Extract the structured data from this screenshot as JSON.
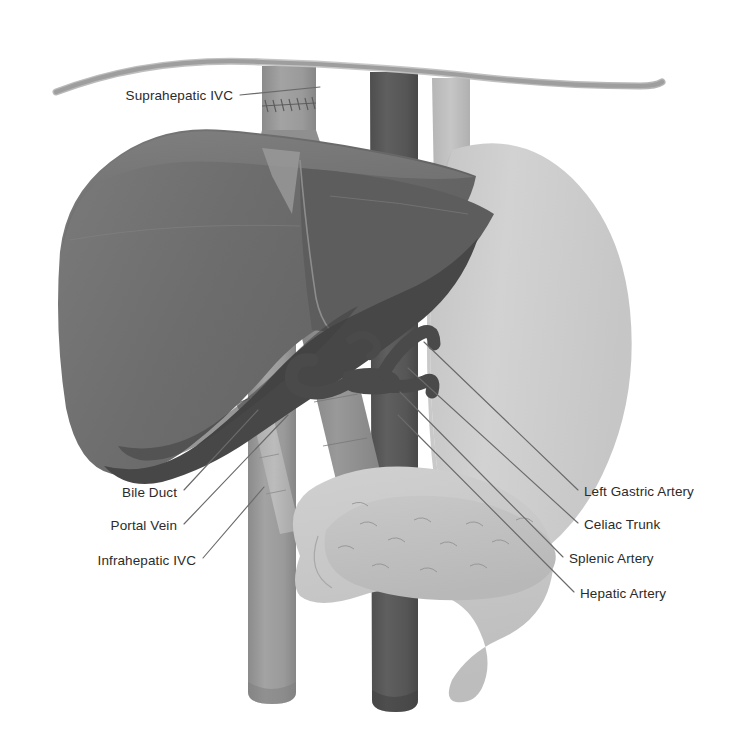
{
  "figure": {
    "background_color": "#ffffff"
  },
  "palette": {
    "liver_main": "#6e6e6e",
    "liver_upper": "#747474",
    "liver_shadow": "#474747",
    "liver_lobe_dark": "#5b5b5b",
    "stomach": "#cfcfcf",
    "duodenum": "#c9c9c9",
    "pancreas": "#c2c2c2",
    "aorta": "#595959",
    "ivc": "#9a9a9a",
    "portal_vein": "#8f8f8f",
    "bile_duct": "#b4b4b4",
    "artery_dark": "#4e4e4e",
    "diaphragm": "#9e9e9e",
    "leader_line": "#6a6a6a",
    "label_text": "#2b2b2b"
  },
  "labels": {
    "suprahepatic_ivc": {
      "text": "Suprahepatic IVC",
      "side": "left",
      "text_x": 233,
      "text_y": 100,
      "leader": "M 240 95 L 320 87"
    },
    "bile_duct": {
      "text": "Bile Duct",
      "side": "left",
      "text_x": 177,
      "text_y": 497,
      "leader": "M 184 490 L 258 410"
    },
    "portal_vein": {
      "text": "Portal Vein",
      "side": "left",
      "text_x": 177,
      "text_y": 530,
      "leader": "M 184 524 L 288 415"
    },
    "infrahepatic_ivc": {
      "text": "Infrahepatic IVC",
      "side": "left",
      "text_x": 196,
      "text_y": 565,
      "leader": "M 203 558 L 264 487"
    },
    "left_gastric_artery": {
      "text": "Left Gastric Artery",
      "side": "right",
      "text_x": 584,
      "text_y": 496,
      "leader": "M 578 490 L 424 342"
    },
    "celiac_trunk": {
      "text": "Celiac Trunk",
      "side": "right",
      "text_x": 584,
      "text_y": 529,
      "leader": "M 578 523 L 408 368"
    },
    "splenic_artery": {
      "text": "Splenic Artery",
      "side": "right",
      "text_x": 569,
      "text_y": 563,
      "leader": "M 563 557 L 400 392"
    },
    "hepatic_artery": {
      "text": "Hepatic Artery",
      "side": "right",
      "text_x": 580,
      "text_y": 598,
      "leader": "M 574 592 L 398 415"
    }
  },
  "structures": {
    "diaphragm": "diaphragm-line",
    "liver": "liver-organ",
    "stomach": "stomach-organ",
    "duodenum": "duodenum-organ",
    "pancreas": "pancreas-organ",
    "aorta": "aorta-vessel",
    "ivc_suprahepatic": "suprahepatic-ivc-vessel",
    "ivc_infrahepatic": "infrahepatic-ivc-vessel",
    "portal_vein": "portal-vein-vessel",
    "bile_duct": "bile-duct-structure",
    "esophagus": "esophagus-structure",
    "celiac_trunk": "celiac-trunk-vessel",
    "left_gastric_artery": "left-gastric-artery-vessel",
    "splenic_artery": "splenic-artery-vessel",
    "hepatic_artery": "hepatic-artery-vessel",
    "anastomosis_sutures": "ivc-anastomosis-sutures"
  }
}
